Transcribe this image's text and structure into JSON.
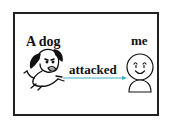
{
  "diagram": {
    "subject_label": "A dog",
    "verb_label": "attacked",
    "object_label": "me",
    "arrow_color": "#3bb0c4",
    "frame_color": "#222222"
  }
}
